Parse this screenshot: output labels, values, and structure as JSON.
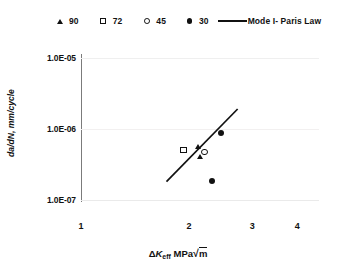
{
  "chart_data": {
    "type": "scatter",
    "title": "",
    "xlabel": "ΔKeff MPa√m",
    "ylabel": "da/dN, mm/cycle",
    "xscale": "log",
    "yscale": "log",
    "xlim": [
      1,
      4.6
    ],
    "ylim": [
      1e-07,
      3.16e-05
    ],
    "xticks": [
      "1",
      "2",
      "3",
      "4"
    ],
    "xtick_values": [
      1,
      2,
      3,
      4
    ],
    "yticks": [
      "1.0E-05",
      "1.0E-06",
      "1.0E-07"
    ],
    "ytick_values": [
      1e-05,
      1e-06,
      1e-07
    ],
    "grid": "horizontal",
    "legend_position": "top",
    "series": [
      {
        "name": "90",
        "marker": "filled-triangle",
        "points": [
          {
            "x": 2.12,
            "y": 8.5e-07
          },
          {
            "x": 2.15,
            "y": 5.8e-07
          }
        ]
      },
      {
        "name": "72",
        "marker": "open-square",
        "points": [
          {
            "x": 1.93,
            "y": 7.5e-07
          }
        ]
      },
      {
        "name": "45",
        "marker": "open-circle",
        "points": [
          {
            "x": 2.21,
            "y": 7e-07
          }
        ]
      },
      {
        "name": "30",
        "marker": "filled-circle",
        "points": [
          {
            "x": 2.45,
            "y": 1.5e-06
          },
          {
            "x": 2.31,
            "y": 2.2e-07
          }
        ]
      },
      {
        "name": "Mode I- Paris Law",
        "marker": "line",
        "line": {
          "x1": 1.73,
          "y1": 2.1e-07,
          "x2": 2.73,
          "y2": 4e-06
        }
      }
    ]
  },
  "legend": {
    "entries": [
      {
        "label": "90",
        "marker": "filled-triangle"
      },
      {
        "label": "72",
        "marker": "open-square"
      },
      {
        "label": "45",
        "marker": "open-circle"
      },
      {
        "label": "30",
        "marker": "filled-circle"
      },
      {
        "label": "Mode I- Paris Law",
        "marker": "line"
      }
    ]
  },
  "axes": {
    "y_title": "da/dN, mm/cycle",
    "y_ticks": [
      "1.0E-05",
      "1.0E-06",
      "1.0E-07"
    ],
    "x_ticks": [
      "1",
      "2",
      "3",
      "4"
    ],
    "x_title_delta": "Δ",
    "x_title_k": "K",
    "x_title_sub": "eff",
    "x_title_unit": "MPa",
    "x_title_radical": "√",
    "x_title_m": "m"
  },
  "colors": {
    "marker": "#111111",
    "grid": "#efefef",
    "axis": "#7b7b7b",
    "background": "#ffffff"
  }
}
